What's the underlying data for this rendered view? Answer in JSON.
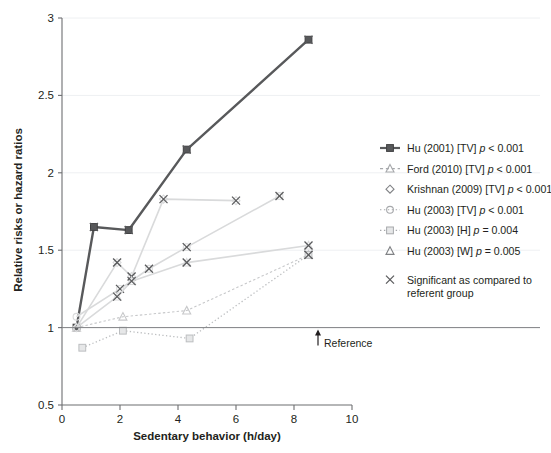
{
  "chart_data": {
    "type": "line",
    "title": "",
    "xlabel": "Sedentary behavior (h/day)",
    "ylabel": "Relative risks or hazard ratios",
    "xlim": [
      0,
      10
    ],
    "ylim": [
      0.5,
      3
    ],
    "xticks": [
      "0",
      "2",
      "4",
      "6",
      "8",
      "10"
    ],
    "xtick_values": [
      0,
      2,
      4,
      6,
      8,
      10
    ],
    "yticks": [
      "0.5",
      "1",
      "1.5",
      "2",
      "2.5",
      "3"
    ],
    "ytick_values": [
      0.5,
      1,
      1.5,
      2,
      2.5,
      3
    ],
    "grid": "horizontal-light",
    "legend_position": "right",
    "reference_line": {
      "y": 1,
      "label": "Reference"
    },
    "series": [
      {
        "name": "Hu (2001) [TV] p < 0.001",
        "key": "hu2001-tv",
        "marker": "square-filled",
        "line": "solid",
        "color": "#58595b",
        "width": 2.4,
        "x": [
          0.5,
          1.1,
          2.3,
          4.3,
          8.5
        ],
        "y": [
          1.0,
          1.65,
          1.63,
          2.15,
          2.86
        ],
        "significant": [
          false,
          true,
          true,
          true,
          true
        ]
      },
      {
        "name": "Ford (2010) [TV] p < 0.001",
        "key": "ford2010-tv",
        "marker": "triangle-open",
        "line": "dashed",
        "color": "#c7c8ca",
        "width": 1.1,
        "x": [
          0.5,
          2.1,
          4.3,
          8.5
        ],
        "y": [
          1.0,
          1.07,
          1.11,
          1.47
        ],
        "significant": [
          false,
          false,
          false,
          true
        ]
      },
      {
        "name": "Krishnan (2009) [TV] p < 0.001",
        "key": "krishnan2009-tv",
        "marker": "diamond-open",
        "line": "solid",
        "color": "#d9dadb",
        "width": 1.6,
        "x": [
          0.5,
          1.9,
          2.4,
          3.5,
          6.0
        ],
        "y": [
          1.0,
          1.42,
          1.33,
          1.83,
          1.82
        ],
        "significant": [
          false,
          true,
          true,
          true,
          true
        ]
      },
      {
        "name": "Hu (2003) [TV] p < 0.001",
        "key": "hu2003-tv",
        "marker": "circle-open",
        "line": "solid",
        "color": "#d9dadb",
        "width": 1.6,
        "x": [
          0.5,
          2.0,
          3.0,
          4.3,
          7.5
        ],
        "y": [
          1.07,
          1.25,
          1.38,
          1.52,
          1.85
        ],
        "significant": [
          false,
          true,
          true,
          true,
          true
        ]
      },
      {
        "name": "Hu (2003) [H]  p = 0.004",
        "key": "hu2003-h",
        "marker": "square-open",
        "line": "dotted",
        "color": "#bcbec0",
        "width": 1.3,
        "x": [
          0.7,
          2.1,
          4.4,
          8.5
        ],
        "y": [
          0.87,
          0.98,
          0.93,
          1.47
        ],
        "significant": [
          false,
          false,
          false,
          true
        ]
      },
      {
        "name": "Hu (2003) [W]  p = 0.005",
        "key": "hu2003-w",
        "marker": "triangle-open",
        "line": "solid",
        "color": "#d9dadb",
        "width": 1.6,
        "x": [
          0.5,
          1.9,
          2.4,
          4.3,
          8.5
        ],
        "y": [
          1.0,
          1.2,
          1.3,
          1.42,
          1.53
        ],
        "significant": [
          false,
          true,
          true,
          true,
          true
        ]
      }
    ]
  },
  "legend": {
    "items": [
      {
        "label": "Hu (2001) [TV] ",
        "stat": "p < 0.001",
        "marker": "square-filled",
        "line": "solid",
        "color": "#58595b"
      },
      {
        "label": "Ford (2010) [TV] ",
        "stat": "p < 0.001",
        "marker": "triangle-open",
        "line": "dashed",
        "color": "#a7a9ac"
      },
      {
        "label": "Krishnan (2009) [TV] ",
        "stat": "p < 0.001",
        "marker": "diamond-open",
        "line": "none",
        "color": "#808285"
      },
      {
        "label": "Hu (2003) [TV] ",
        "stat": "p < 0.001",
        "marker": "circle-open",
        "line": "dotted",
        "color": "#a7a9ac"
      },
      {
        "label": "Hu (2003) [H]  ",
        "stat": "p = 0.004",
        "marker": "square-open",
        "line": "dotted",
        "color": "#a7a9ac"
      },
      {
        "label": "Hu (2003) [W]  ",
        "stat": "p = 0.005",
        "marker": "triangle-open",
        "line": "none",
        "color": "#808285"
      }
    ],
    "significance_note": {
      "marker": "x-cross",
      "line1": "Significant as compared to",
      "line2": "referent group"
    }
  }
}
